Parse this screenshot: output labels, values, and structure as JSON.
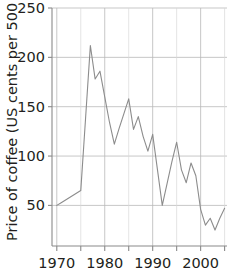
{
  "chart_data": {
    "type": "line",
    "title": "",
    "subtitle": "",
    "xlabel": "",
    "ylabel": "Price of coffee (US cents per 500 g)",
    "xlim": [
      1969,
      2005.5
    ],
    "ylim": [
      0,
      250
    ],
    "grid": true,
    "legend": null,
    "x_ticks_major": [
      1970,
      1980,
      1990,
      2000
    ],
    "x_tick_labels": [
      "1970",
      "1980",
      "1990",
      "2000"
    ],
    "x_ticks_minor": [
      1975,
      1985,
      1995,
      2005
    ],
    "y_ticks": [
      50,
      100,
      150,
      200,
      250
    ],
    "y_tick_labels": [
      "50",
      "100",
      "150",
      "200",
      "250"
    ],
    "series": [
      {
        "name": "Price of coffee",
        "color": "#8c8c8c",
        "x": [
          1970,
          1971,
          1972,
          1973,
          1974,
          1975,
          1976,
          1977,
          1978,
          1979,
          1980,
          1981,
          1982,
          1983,
          1984,
          1985,
          1986,
          1987,
          1988,
          1989,
          1990,
          1991,
          1992,
          1993,
          1994,
          1995,
          1996,
          1997,
          1998,
          1999,
          2000,
          2001,
          2002,
          2003,
          2004,
          2005
        ],
        "y": [
          50,
          53,
          56,
          59,
          62,
          65,
          138,
          212,
          178,
          186,
          160,
          134,
          112,
          128,
          143,
          158,
          127,
          140,
          120,
          105,
          122,
          86,
          50,
          72,
          94,
          114,
          86,
          73,
          93,
          80,
          46,
          30,
          37,
          25,
          37,
          47
        ]
      }
    ]
  },
  "axes": {
    "y_axis_name": "y-axis",
    "x_axis_name": "x-axis"
  }
}
